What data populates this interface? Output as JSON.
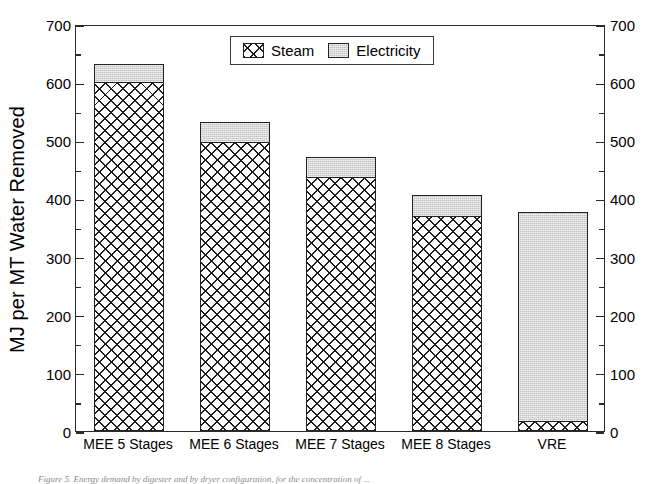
{
  "chart_data": {
    "type": "bar",
    "subtype": "stacked-vertical",
    "title": "",
    "xlabel": "",
    "ylabel": "MJ per MT Water Removed",
    "ylim": [
      0,
      700
    ],
    "y_major_step": 100,
    "y_minor_step": 50,
    "y_ticks": [
      0,
      100,
      200,
      300,
      400,
      500,
      600,
      700
    ],
    "y_tick_labels": [
      "0",
      "100",
      "200",
      "300",
      "400",
      "500",
      "600",
      "700"
    ],
    "right_axis_mirrored": true,
    "right_y_tick_labels": [
      "0",
      "100",
      "200",
      "300",
      "400",
      "500",
      "600",
      "700"
    ],
    "grid": false,
    "legend_position": "top-center-inside",
    "categories": [
      "MEE 5 Stages",
      "MEE 6 Stages",
      "MEE 7 Stages",
      "MEE 8 Stages",
      "VRE"
    ],
    "series": [
      {
        "name": "Steam",
        "fill": "cross-hatch",
        "color": "#ffffff",
        "hatch_color": "#1c1c1c",
        "values": [
          600,
          498,
          438,
          371,
          17
        ]
      },
      {
        "name": "Electricity",
        "fill": "light-grey-stipple",
        "color": "#c3c3c3",
        "values": [
          32,
          33,
          33,
          35,
          360
        ]
      }
    ],
    "totals": [
      632,
      531,
      471,
      406,
      377
    ],
    "units": "MJ per MT Water Removed"
  },
  "axes": {
    "y_label": "MJ per MT Water Removed",
    "left_ticks": [
      "700",
      "600",
      "500",
      "400",
      "300",
      "200",
      "100",
      "0"
    ],
    "right_ticks": [
      "700",
      "600",
      "500",
      "400",
      "300",
      "200",
      "100",
      "0"
    ]
  },
  "legend": {
    "entries": [
      {
        "label": "Steam",
        "swatch": "hatch-swatch"
      },
      {
        "label": "Electricity",
        "swatch": "grey-swatch"
      }
    ]
  },
  "categories": [
    {
      "label": "MEE 5 Stages"
    },
    {
      "label": "MEE 6 Stages"
    },
    {
      "label": "MEE 7 Stages"
    },
    {
      "label": "MEE 8 Stages"
    },
    {
      "label": "VRE"
    }
  ],
  "caption": {
    "text": "Figure 5.  Energy demand by digester and by dryer configuration, for the concentration of ..."
  },
  "colors": {
    "axis": "#2b2b2b",
    "steam_hatch": "#1c1c1c",
    "electricity": "#c3c3c3",
    "background": "#ffffff"
  }
}
